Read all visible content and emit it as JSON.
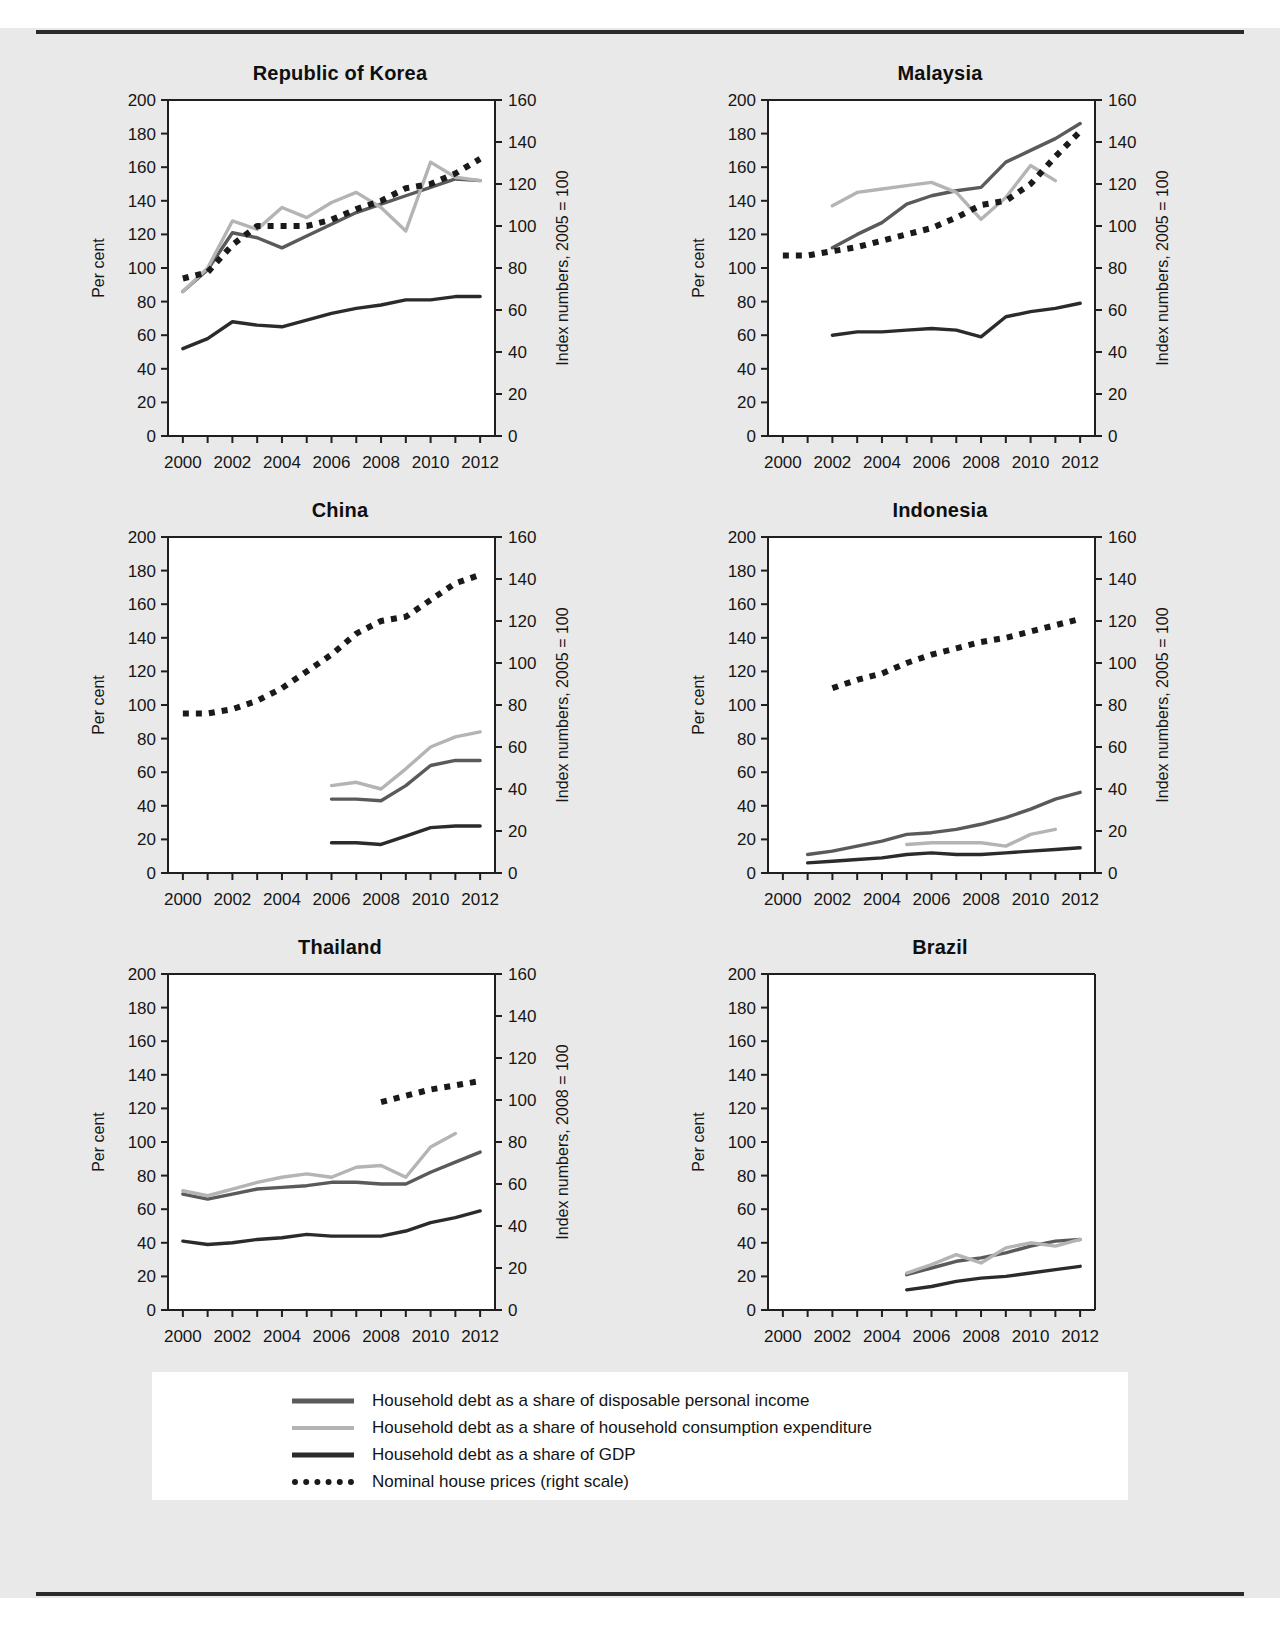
{
  "figure": {
    "left_axis_label": "Per cent",
    "x_ticks": [
      2000,
      2002,
      2004,
      2006,
      2008,
      2010,
      2012
    ],
    "x_range": [
      1999.4,
      2012.6
    ],
    "left_ticks": [
      0,
      20,
      40,
      60,
      80,
      100,
      120,
      140,
      160,
      180,
      200
    ],
    "left_range": [
      0,
      200
    ],
    "right_ticks": [
      0,
      20,
      40,
      60,
      80,
      100,
      120,
      140,
      160
    ],
    "right_range": [
      0,
      160
    ]
  },
  "colors": {
    "disposable_income": "#5a5a5a",
    "consumption": "#b4b4b4",
    "gdp": "#2b2b2b",
    "house_prices": "#1a1a1a",
    "axis": "#1f1f1f",
    "panel_background": "#ffffff",
    "page_background": "#e9e9e9"
  },
  "legend": {
    "items": [
      {
        "label": "Household debt as a share of disposable personal income",
        "style": "solid",
        "color": "#5a5a5a",
        "swatch": "legend-line-disposable-income"
      },
      {
        "label": "Household debt as a share of household consumption expenditure",
        "style": "solid",
        "color": "#b4b4b4",
        "swatch": "legend-line-consumption"
      },
      {
        "label": "Household debt as a share of GDP",
        "style": "solid",
        "color": "#2b2b2b",
        "swatch": "legend-line-gdp"
      },
      {
        "label": "Nominal house prices (right scale)",
        "style": "dotted",
        "color": "#1a1a1a",
        "swatch": "legend-line-house-prices"
      }
    ]
  },
  "chart_data": [
    {
      "type": "line",
      "title": "Republic of Korea",
      "xlabel": "",
      "ylabel": "Per cent",
      "y2label": "Index numbers, 2005 = 100",
      "xlim": [
        1999.4,
        2012.6
      ],
      "ylim": [
        0,
        200
      ],
      "y2lim": [
        0,
        160
      ],
      "grid": false,
      "xticks": [
        2000,
        2002,
        2004,
        2006,
        2008,
        2010,
        2012
      ],
      "yticks": [
        0,
        20,
        40,
        60,
        80,
        100,
        120,
        140,
        160,
        180,
        200
      ],
      "y2ticks": [
        0,
        20,
        40,
        60,
        80,
        100,
        120,
        140,
        160
      ],
      "series": [
        {
          "name": "Household debt as a share of disposable personal income",
          "axis": "left",
          "style": "solid",
          "color": "#5a5a5a",
          "x": [
            2000,
            2001,
            2002,
            2003,
            2004,
            2005,
            2006,
            2007,
            2008,
            2009,
            2010,
            2011,
            2012
          ],
          "values": [
            86,
            99,
            121,
            118,
            112,
            119,
            126,
            133,
            138,
            143,
            148,
            153,
            152
          ]
        },
        {
          "name": "Household debt as a share of household consumption expenditure",
          "axis": "left",
          "style": "solid",
          "color": "#b4b4b4",
          "x": [
            2000,
            2001,
            2002,
            2003,
            2004,
            2005,
            2006,
            2007,
            2008,
            2009,
            2010,
            2011,
            2012
          ],
          "values": [
            86,
            100,
            128,
            123,
            136,
            130,
            139,
            145,
            136,
            122,
            163,
            154,
            152
          ]
        },
        {
          "name": "Household debt as a share of GDP",
          "axis": "left",
          "style": "solid",
          "color": "#2b2b2b",
          "x": [
            2000,
            2001,
            2002,
            2003,
            2004,
            2005,
            2006,
            2007,
            2008,
            2009,
            2010,
            2011,
            2012
          ],
          "values": [
            52,
            58,
            68,
            66,
            65,
            69,
            73,
            76,
            78,
            81,
            81,
            83,
            83
          ]
        },
        {
          "name": "Nominal house prices (right scale)",
          "axis": "right",
          "style": "dotted",
          "color": "#1a1a1a",
          "x": [
            2000,
            2001,
            2002,
            2003,
            2004,
            2005,
            2006,
            2007,
            2008,
            2009,
            2010,
            2011,
            2012
          ],
          "values": [
            75,
            78,
            91,
            100,
            100,
            100,
            103,
            108,
            112,
            118,
            120,
            125,
            132
          ]
        }
      ]
    },
    {
      "type": "line",
      "title": "Malaysia",
      "xlabel": "",
      "ylabel": "Per cent",
      "y2label": "Index numbers, 2005 = 100",
      "xlim": [
        1999.4,
        2012.6
      ],
      "ylim": [
        0,
        200
      ],
      "y2lim": [
        0,
        160
      ],
      "grid": false,
      "xticks": [
        2000,
        2002,
        2004,
        2006,
        2008,
        2010,
        2012
      ],
      "yticks": [
        0,
        20,
        40,
        60,
        80,
        100,
        120,
        140,
        160,
        180,
        200
      ],
      "y2ticks": [
        0,
        20,
        40,
        60,
        80,
        100,
        120,
        140,
        160
      ],
      "series": [
        {
          "name": "Household debt as a share of disposable personal income",
          "axis": "left",
          "style": "solid",
          "color": "#5a5a5a",
          "x": [
            2002,
            2003,
            2004,
            2005,
            2006,
            2007,
            2008,
            2009,
            2010,
            2011,
            2012
          ],
          "values": [
            112,
            120,
            127,
            138,
            143,
            146,
            148,
            163,
            170,
            177,
            186
          ]
        },
        {
          "name": "Household debt as a share of household consumption expenditure",
          "axis": "left",
          "style": "solid",
          "color": "#b4b4b4",
          "x": [
            2002,
            2003,
            2004,
            2005,
            2006,
            2007,
            2008,
            2009,
            2010,
            2011
          ],
          "values": [
            137,
            145,
            147,
            149,
            151,
            145,
            129,
            142,
            161,
            152
          ]
        },
        {
          "name": "Household debt as a share of GDP",
          "axis": "left",
          "style": "solid",
          "color": "#2b2b2b",
          "x": [
            2002,
            2003,
            2004,
            2005,
            2006,
            2007,
            2008,
            2009,
            2010,
            2011,
            2012
          ],
          "values": [
            60,
            62,
            62,
            63,
            64,
            63,
            59,
            71,
            74,
            76,
            79
          ]
        },
        {
          "name": "Nominal house prices (right scale)",
          "axis": "right",
          "style": "dotted",
          "color": "#1a1a1a",
          "x": [
            2000,
            2001,
            2002,
            2003,
            2004,
            2005,
            2006,
            2007,
            2008,
            2009,
            2010,
            2011,
            2012
          ],
          "values": [
            86,
            86,
            88,
            90,
            93,
            96,
            99,
            104,
            110,
            112,
            120,
            133,
            145
          ]
        }
      ]
    },
    {
      "type": "line",
      "title": "China",
      "xlabel": "",
      "ylabel": "Per cent",
      "y2label": "Index numbers, 2005 = 100",
      "xlim": [
        1999.4,
        2012.6
      ],
      "ylim": [
        0,
        200
      ],
      "y2lim": [
        0,
        160
      ],
      "grid": false,
      "xticks": [
        2000,
        2002,
        2004,
        2006,
        2008,
        2010,
        2012
      ],
      "yticks": [
        0,
        20,
        40,
        60,
        80,
        100,
        120,
        140,
        160,
        180,
        200
      ],
      "y2ticks": [
        0,
        20,
        40,
        60,
        80,
        100,
        120,
        140,
        160
      ],
      "series": [
        {
          "name": "Household debt as a share of disposable personal income",
          "axis": "left",
          "style": "solid",
          "color": "#5a5a5a",
          "x": [
            2006,
            2007,
            2008,
            2009,
            2010,
            2011,
            2012
          ],
          "values": [
            44,
            44,
            43,
            52,
            64,
            67,
            67
          ]
        },
        {
          "name": "Household debt as a share of household consumption expenditure",
          "axis": "left",
          "style": "solid",
          "color": "#b4b4b4",
          "x": [
            2006,
            2007,
            2008,
            2009,
            2010,
            2011,
            2012
          ],
          "values": [
            52,
            54,
            50,
            62,
            75,
            81,
            84
          ]
        },
        {
          "name": "Household debt as a share of GDP",
          "axis": "left",
          "style": "solid",
          "color": "#2b2b2b",
          "x": [
            2006,
            2007,
            2008,
            2009,
            2010,
            2011,
            2012
          ],
          "values": [
            18,
            18,
            17,
            22,
            27,
            28,
            28
          ]
        },
        {
          "name": "Nominal house prices (right scale)",
          "axis": "right",
          "style": "dotted",
          "color": "#1a1a1a",
          "x": [
            2000,
            2001,
            2002,
            2003,
            2004,
            2005,
            2006,
            2007,
            2008,
            2009,
            2010,
            2011,
            2012
          ],
          "values": [
            76,
            76,
            78,
            82,
            88,
            96,
            104,
            114,
            120,
            122,
            130,
            138,
            142
          ]
        }
      ]
    },
    {
      "type": "line",
      "title": "Indonesia",
      "xlabel": "",
      "ylabel": "Per cent",
      "y2label": "Index numbers, 2005 = 100",
      "xlim": [
        1999.4,
        2012.6
      ],
      "ylim": [
        0,
        200
      ],
      "y2lim": [
        0,
        160
      ],
      "grid": false,
      "xticks": [
        2000,
        2002,
        2004,
        2006,
        2008,
        2010,
        2012
      ],
      "yticks": [
        0,
        20,
        40,
        60,
        80,
        100,
        120,
        140,
        160,
        180,
        200
      ],
      "y2ticks": [
        0,
        20,
        40,
        60,
        80,
        100,
        120,
        140,
        160
      ],
      "series": [
        {
          "name": "Household debt as a share of disposable personal income",
          "axis": "left",
          "style": "solid",
          "color": "#5a5a5a",
          "x": [
            2001,
            2002,
            2003,
            2004,
            2005,
            2006,
            2007,
            2008,
            2009,
            2010,
            2011,
            2012
          ],
          "values": [
            11,
            13,
            16,
            19,
            23,
            24,
            26,
            29,
            33,
            38,
            44,
            48
          ]
        },
        {
          "name": "Household debt as a share of household consumption expenditure",
          "axis": "left",
          "style": "solid",
          "color": "#b4b4b4",
          "x": [
            2005,
            2006,
            2007,
            2008,
            2009,
            2010,
            2011
          ],
          "values": [
            17,
            18,
            18,
            18,
            16,
            23,
            26
          ]
        },
        {
          "name": "Household debt as a share of GDP",
          "axis": "left",
          "style": "solid",
          "color": "#2b2b2b",
          "x": [
            2001,
            2002,
            2003,
            2004,
            2005,
            2006,
            2007,
            2008,
            2009,
            2010,
            2011,
            2012
          ],
          "values": [
            6,
            7,
            8,
            9,
            11,
            12,
            11,
            11,
            12,
            13,
            14,
            15
          ]
        },
        {
          "name": "Nominal house prices (right scale)",
          "axis": "right",
          "style": "dotted",
          "color": "#1a1a1a",
          "x": [
            2002,
            2003,
            2004,
            2005,
            2006,
            2007,
            2008,
            2009,
            2010,
            2011,
            2012
          ],
          "values": [
            88,
            92,
            95,
            100,
            104,
            107,
            110,
            112,
            115,
            118,
            121
          ]
        }
      ]
    },
    {
      "type": "line",
      "title": "Thailand",
      "xlabel": "",
      "ylabel": "Per cent",
      "y2label": "Index numbers, 2008 = 100",
      "xlim": [
        1999.4,
        2012.6
      ],
      "ylim": [
        0,
        200
      ],
      "y2lim": [
        0,
        160
      ],
      "grid": false,
      "xticks": [
        2000,
        2002,
        2004,
        2006,
        2008,
        2010,
        2012
      ],
      "yticks": [
        0,
        20,
        40,
        60,
        80,
        100,
        120,
        140,
        160,
        180,
        200
      ],
      "y2ticks": [
        0,
        20,
        40,
        60,
        80,
        100,
        120,
        140,
        160
      ],
      "series": [
        {
          "name": "Household debt as a share of disposable personal income",
          "axis": "left",
          "style": "solid",
          "color": "#5a5a5a",
          "x": [
            2000,
            2001,
            2002,
            2003,
            2004,
            2005,
            2006,
            2007,
            2008,
            2009,
            2010,
            2011,
            2012
          ],
          "values": [
            69,
            66,
            69,
            72,
            73,
            74,
            76,
            76,
            75,
            75,
            82,
            88,
            94
          ]
        },
        {
          "name": "Household debt as a share of household consumption expenditure",
          "axis": "left",
          "style": "solid",
          "color": "#b4b4b4",
          "x": [
            2000,
            2001,
            2002,
            2003,
            2004,
            2005,
            2006,
            2007,
            2008,
            2009,
            2010,
            2011
          ],
          "values": [
            71,
            68,
            72,
            76,
            79,
            81,
            79,
            85,
            86,
            79,
            97,
            105
          ]
        },
        {
          "name": "Household debt as a share of GDP",
          "axis": "left",
          "style": "solid",
          "color": "#2b2b2b",
          "x": [
            2000,
            2001,
            2002,
            2003,
            2004,
            2005,
            2006,
            2007,
            2008,
            2009,
            2010,
            2011,
            2012
          ],
          "values": [
            41,
            39,
            40,
            42,
            43,
            45,
            44,
            44,
            44,
            47,
            52,
            55,
            59
          ]
        },
        {
          "name": "Nominal house prices (right scale)",
          "axis": "right",
          "style": "dotted",
          "color": "#1a1a1a",
          "x": [
            2008,
            2009,
            2010,
            2011,
            2012
          ],
          "values": [
            99,
            102,
            105,
            107,
            109
          ]
        }
      ]
    },
    {
      "type": "line",
      "title": "Brazil",
      "xlabel": "",
      "ylabel": "Per cent",
      "y2label": "",
      "xlim": [
        1999.4,
        2012.6
      ],
      "ylim": [
        0,
        200
      ],
      "y2lim": null,
      "grid": false,
      "xticks": [
        2000,
        2002,
        2004,
        2006,
        2008,
        2010,
        2012
      ],
      "yticks": [
        0,
        20,
        40,
        60,
        80,
        100,
        120,
        140,
        160,
        180,
        200
      ],
      "y2ticks": [],
      "series": [
        {
          "name": "Household debt as a share of disposable personal income",
          "axis": "left",
          "style": "solid",
          "color": "#5a5a5a",
          "x": [
            2005,
            2006,
            2007,
            2008,
            2009,
            2010,
            2011,
            2012
          ],
          "values": [
            21,
            25,
            29,
            31,
            34,
            38,
            41,
            42
          ]
        },
        {
          "name": "Household debt as a share of household consumption expenditure",
          "axis": "left",
          "style": "solid",
          "color": "#b4b4b4",
          "x": [
            2005,
            2006,
            2007,
            2008,
            2009,
            2010,
            2011,
            2012
          ],
          "values": [
            22,
            27,
            33,
            28,
            37,
            40,
            38,
            42
          ]
        },
        {
          "name": "Household debt as a share of GDP",
          "axis": "left",
          "style": "solid",
          "color": "#2b2b2b",
          "x": [
            2005,
            2006,
            2007,
            2008,
            2009,
            2010,
            2011,
            2012
          ],
          "values": [
            12,
            14,
            17,
            19,
            20,
            22,
            24,
            26
          ]
        }
      ]
    }
  ]
}
